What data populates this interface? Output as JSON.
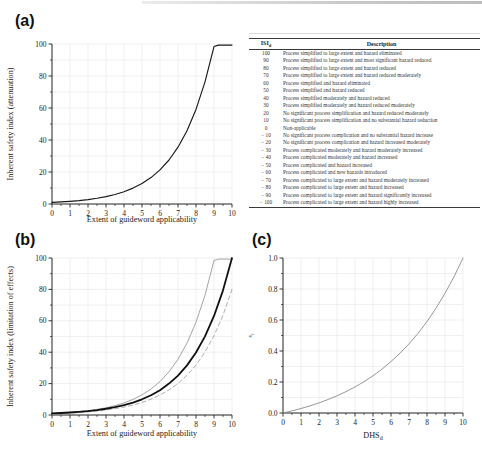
{
  "panels": {
    "a_label": "(a)",
    "b_label": "(b)",
    "c_label": "(c)"
  },
  "table": {
    "col1_header_main": "ISI",
    "col1_header_sub": "d",
    "col2_header": "Description",
    "rows": [
      [
        "100",
        "Process simplified to large extent and hazard eliminated"
      ],
      [
        "90",
        "Process simplified to large extent and most significant hazard reduced"
      ],
      [
        "80",
        "Process simplified to large extent and hazard reduced"
      ],
      [
        "70",
        "Process simplified to large extent and hazard reduced moderately"
      ],
      [
        "60",
        "Process simplified and hazard eliminated"
      ],
      [
        "50",
        "Process simplified and hazard reduced"
      ],
      [
        "40",
        "Process simplified moderately and hazard reduced"
      ],
      [
        "30",
        "Process simplified moderately and hazard reduced moderately"
      ],
      [
        "20",
        "No significant process simplification and hazard reduced moderately"
      ],
      [
        "10",
        "No significant process simplification and no substantial hazard reduction"
      ],
      [
        "0",
        "Non-applicable"
      ],
      [
        "− 10",
        "No significant process complication and no substantial hazard increase"
      ],
      [
        "− 20",
        "No significant process complication and hazard increased moderately"
      ],
      [
        "− 30",
        "Process complicated moderately and hazard moderately increased"
      ],
      [
        "− 40",
        "Process complicated moderately and hazard increased"
      ],
      [
        "− 50",
        "Process complicated and hazard increased"
      ],
      [
        "− 60",
        "Process complicated and new hazards introduced"
      ],
      [
        "− 70",
        "Process complicated to large extent and hazard moderately increased"
      ],
      [
        "− 80",
        "Process complicated to large extent and hazard increased"
      ],
      [
        "− 90",
        "Process complicated to large extent and hazard significantly increased"
      ],
      [
        "− 100",
        "Process complicated to large extent and hazard highly increased"
      ]
    ]
  },
  "chart_data": [
    {
      "type": "line",
      "title": "",
      "xlabel": "Extent of guideword applicability",
      "ylabel": "Inherent safety index (attenuation)",
      "xlim": [
        0,
        10
      ],
      "ylim": [
        0,
        100
      ],
      "xtick_values": [
        0,
        1,
        2,
        3,
        4,
        5,
        6,
        7,
        8,
        9,
        10
      ],
      "xtick_labels": [
        "0",
        "1",
        "2",
        "3",
        "4",
        "5",
        "6",
        "7",
        "8",
        "9",
        "10"
      ],
      "ytick_values": [
        0,
        20,
        40,
        60,
        80,
        100
      ],
      "ytick_labels": [
        "0",
        "20",
        "40",
        "60",
        "80",
        "100"
      ],
      "x_minor_step": 0.5,
      "y_minor_step": 10,
      "grid": {
        "on": true,
        "x_step": 1,
        "y_step": 10
      },
      "legend": "none",
      "series": [
        {
          "name": "inherent-safety-index-attenuation",
          "color": "#1a1a1a",
          "width": 1.15,
          "dash": null,
          "x": [
            0,
            0.5,
            1,
            1.5,
            2,
            2.5,
            3,
            3.5,
            4,
            4.5,
            5,
            5.5,
            6,
            6.5,
            7,
            7.5,
            8,
            8.5,
            9,
            9.25,
            9.5,
            10
          ],
          "y": [
            1,
            1.29,
            1.67,
            2.15,
            2.77,
            3.58,
            4.62,
            5.96,
            7.69,
            9.93,
            12.8,
            16.5,
            21.3,
            27.5,
            35.5,
            45.8,
            59.1,
            76.3,
            98.4,
            99.3,
            99.3,
            99.3
          ]
        }
      ]
    },
    {
      "type": "line",
      "title": "",
      "xlabel": "Extent of guideword applicability",
      "ylabel": "Inherent safety index (limitation of effects)",
      "xlim": [
        0,
        10
      ],
      "ylim": [
        0,
        100
      ],
      "xtick_values": [
        0,
        1,
        2,
        3,
        4,
        5,
        6,
        7,
        8,
        9,
        10
      ],
      "xtick_labels": [
        "0",
        "1",
        "2",
        "3",
        "4",
        "5",
        "6",
        "7",
        "8",
        "9",
        "10"
      ],
      "ytick_values": [
        0,
        20,
        40,
        60,
        80,
        100
      ],
      "ytick_labels": [
        "0",
        "20",
        "40",
        "60",
        "80",
        "100"
      ],
      "x_minor_step": 0.5,
      "y_minor_step": 10,
      "grid": {
        "on": true,
        "x_step": 1,
        "y_step": 10
      },
      "legend": "none",
      "series": [
        {
          "name": "upper-thin-gray-curve",
          "color": "#9b9b9b",
          "width": 0.9,
          "dash": null,
          "x": [
            0,
            0.5,
            1,
            1.5,
            2,
            2.5,
            3,
            3.5,
            4,
            4.5,
            5,
            5.5,
            6,
            6.5,
            7,
            7.5,
            8,
            8.5,
            9,
            9.25,
            9.5,
            10
          ],
          "y": [
            1,
            1.29,
            1.67,
            2.15,
            2.77,
            3.58,
            4.62,
            5.96,
            7.69,
            9.93,
            12.8,
            16.5,
            21.3,
            27.5,
            35.5,
            45.8,
            59.1,
            76.3,
            98.4,
            99.3,
            99.3,
            99.3
          ]
        },
        {
          "name": "lower-dashed-gray-curve",
          "color": "#b0b0b0",
          "width": 1,
          "dash": "4 3",
          "x": [
            0,
            0.5,
            1,
            1.5,
            2,
            2.5,
            3,
            3.5,
            4,
            4.5,
            5,
            5.5,
            6,
            6.5,
            7,
            7.5,
            8,
            8.5,
            9,
            9.5,
            10
          ],
          "y": [
            0.8,
            1.01,
            1.27,
            1.6,
            2.01,
            2.53,
            3.19,
            4.01,
            5.05,
            6.35,
            8,
            10.1,
            12.7,
            16,
            20.1,
            25.3,
            31.8,
            40.1,
            50.5,
            63.5,
            80
          ]
        },
        {
          "name": "main-thick-black-curve",
          "color": "#111111",
          "width": 1.8,
          "dash": null,
          "x": [
            0,
            0.5,
            1,
            1.5,
            2,
            2.5,
            3,
            3.5,
            4,
            4.5,
            5,
            5.5,
            6,
            6.5,
            7,
            7.5,
            8,
            8.5,
            9,
            9.5,
            10
          ],
          "y": [
            1,
            1.26,
            1.58,
            2,
            2.51,
            3.16,
            3.98,
            5.01,
            6.31,
            7.94,
            10,
            12.6,
            15.8,
            20,
            25.1,
            31.6,
            39.8,
            50.1,
            63.1,
            79.4,
            100
          ]
        }
      ]
    },
    {
      "type": "line",
      "title": "",
      "xlabel": "DHS",
      "xlabel_sub": "d",
      "ylabel": "s",
      "ylabel_sub": "f",
      "xlim": [
        0,
        10
      ],
      "ylim": [
        0,
        1
      ],
      "xtick_values": [
        0,
        1,
        2,
        3,
        4,
        5,
        6,
        7,
        8,
        9,
        10
      ],
      "xtick_labels": [
        "0",
        "1",
        "2",
        "3",
        "4",
        "5",
        "6",
        "7",
        "8",
        "9",
        "10"
      ],
      "ytick_values": [
        0,
        0.2,
        0.4,
        0.6,
        0.8,
        1.0
      ],
      "ytick_labels": [
        "0.0",
        "0.2",
        "0.4",
        "0.6",
        "0.8",
        "1.0"
      ],
      "x_minor_step": 0.5,
      "y_minor_step": 0.1,
      "grid": {
        "on": true,
        "x_step": 1,
        "y_step": 0.1
      },
      "legend": "none",
      "series": [
        {
          "name": "sf-scaling-curve",
          "color": "#8c8c8c",
          "width": 0.9,
          "dash": null,
          "x": [
            0,
            0.5,
            1,
            1.5,
            2,
            2.5,
            3,
            3.5,
            4,
            4.5,
            5,
            5.5,
            6,
            6.5,
            7,
            7.5,
            8,
            8.5,
            9,
            9.5,
            10
          ],
          "y": [
            0,
            0.014,
            0.029,
            0.046,
            0.065,
            0.087,
            0.111,
            0.138,
            0.168,
            0.202,
            0.24,
            0.283,
            0.332,
            0.386,
            0.446,
            0.514,
            0.59,
            0.676,
            0.772,
            0.879,
            1.0
          ]
        }
      ]
    }
  ]
}
